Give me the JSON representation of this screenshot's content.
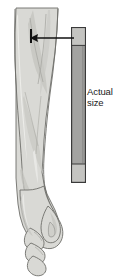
{
  "figure": {
    "background_color": "#ffffff",
    "width": 118,
    "height": 277
  },
  "scale_bar": {
    "name": "actual-size-bar",
    "body_color": "#a3a3a1",
    "cap_color": "#c4c4c1",
    "border_color": "#3a3a3a",
    "top": 27,
    "bottom": 183,
    "left": 71,
    "right": 86
  },
  "label": {
    "line1": "Actual",
    "line2": "size",
    "color": "#1a1a1a"
  },
  "pointer": {
    "name": "leader-arrow",
    "direction": "left",
    "color": "#111111",
    "from_x": 74,
    "to_x": 31,
    "y": 38
  },
  "tick": {
    "name": "measurement-tick",
    "color": "#111111",
    "x": 31,
    "y_top": 29,
    "y_bottom": 43
  },
  "anatomy": {
    "name": "forearm-and-hand",
    "skin_fill": "#d9d9d5",
    "shadow_fill": "#c4c4bf",
    "highlight_fill": "#e8e8e5",
    "outline_color": "#6e6e6a",
    "parts": [
      "forearm",
      "wrist",
      "hand",
      "thumb",
      "fingers"
    ]
  }
}
